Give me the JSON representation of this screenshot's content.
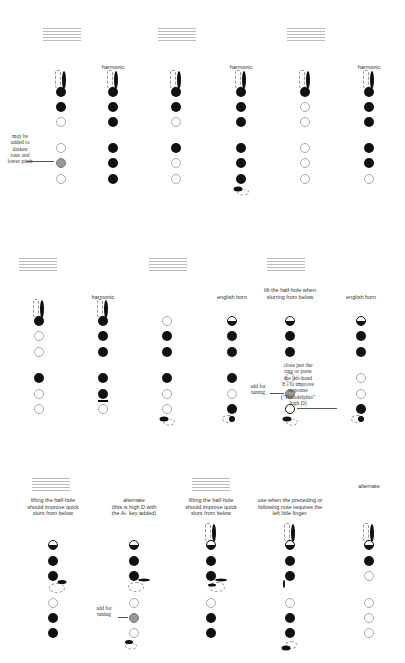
{
  "colors": {
    "closed": "#111111",
    "open_border": "#aaaaaa",
    "gray": "#999999",
    "staff": "#bbbbbb"
  },
  "legend": {
    "closed": "filled black circle = closed hole",
    "open": "white circle = open hole",
    "gray": "gray circle = optional hole",
    "half": "half-filled = half-hole"
  },
  "rows": [
    {
      "staffs": [
        {
          "x": 43,
          "y": 22,
          "notes": "𝅝"
        },
        {
          "x": 158,
          "y": 22,
          "notes": "♯𝅝 ♭𝅝"
        },
        {
          "x": 287,
          "y": 22,
          "notes": "𝅝"
        }
      ],
      "columns": [
        {
          "x": 61,
          "label": "",
          "octave": true,
          "holes": [
            "closed",
            "closed",
            "open",
            "open",
            "gray",
            "open"
          ]
        },
        {
          "x": 113,
          "label": "harmonic",
          "octave": true,
          "holes": [
            "closed",
            "closed",
            "closed",
            "closed",
            "closed",
            "closed"
          ]
        },
        {
          "x": 176,
          "label": "",
          "octave": true,
          "holes": [
            "closed",
            "closed",
            "open",
            "closed",
            "open",
            "open"
          ]
        },
        {
          "x": 241,
          "label": "harmonic",
          "octave": true,
          "holes": [
            "closed",
            "closed",
            "closed",
            "closed",
            "closed",
            "closed"
          ],
          "extra": "low-key"
        },
        {
          "x": 305,
          "label": "",
          "octave": true,
          "holes": [
            "closed",
            "open",
            "open",
            "open",
            "open",
            "open"
          ]
        },
        {
          "x": 369,
          "label": "harmonic",
          "octave": true,
          "holes": [
            "closed",
            "closed",
            "closed",
            "closed",
            "closed",
            "open"
          ]
        }
      ],
      "annotations": [
        {
          "id": "may-be-added",
          "text": [
            "may be",
            "added to",
            "darken",
            "tone and",
            "lower pitch"
          ],
          "x": 20,
          "y": 133
        }
      ]
    },
    {
      "staffs": [
        {
          "x": 19,
          "y": 252,
          "notes": "𝅝"
        },
        {
          "x": 149,
          "y": 252,
          "notes": "♯𝅝 ♭𝅝"
        },
        {
          "x": 267,
          "y": 252,
          "notes": "𝅝"
        }
      ],
      "columns": [
        {
          "x": 39,
          "label": "",
          "octave": true,
          "holes": [
            "closed",
            "open",
            "open",
            "closed",
            "open",
            "open"
          ]
        },
        {
          "x": 103,
          "label": "harmonic",
          "octave": true,
          "holes": [
            "closed",
            "closed",
            "closed",
            "closed",
            "closed",
            "open"
          ],
          "extra": "bar"
        },
        {
          "x": 167,
          "label": "",
          "octave": false,
          "holes": [
            "open",
            "closed",
            "closed",
            "closed",
            "open",
            "open"
          ],
          "extra": "low-key"
        },
        {
          "x": 232,
          "label": "english horn",
          "octave": false,
          "holes": [
            "half",
            "closed",
            "closed",
            "closed",
            "open",
            "closed"
          ],
          "extra": "low-key-dashed"
        },
        {
          "x": 290,
          "label": "lift the half-hole when slurring from below",
          "octave": false,
          "holes": [
            "half",
            "closed",
            "closed",
            "open",
            "gray",
            "bold"
          ],
          "extra": "low-key"
        },
        {
          "x": 361,
          "label": "english horn",
          "octave": false,
          "holes": [
            "half",
            "closed",
            "closed",
            "open",
            "open",
            "closed"
          ],
          "extra": "low-key-dashed"
        }
      ],
      "annotations": [
        {
          "id": "add-for-tuning-1",
          "text": [
            "add for",
            "tuning"
          ],
          "x": 258,
          "y": 383
        },
        {
          "id": "close-ring",
          "text": [
            "close just the",
            "ring or press",
            "the left-hand",
            "E♭ to improve",
            "response",
            "(\"Philadelphia\"",
            "high D)"
          ],
          "x": 298,
          "y": 362
        }
      ]
    },
    {
      "staffs": [
        {
          "x": 32,
          "y": 472,
          "notes": "♯𝅝 ♭𝅝"
        },
        {
          "x": 192,
          "y": 472,
          "notes": "𝅝"
        }
      ],
      "columns": [
        {
          "x": 53,
          "label": "lifting the half-hole should improve quick slurs from below",
          "octave": false,
          "holes": [
            "half",
            "closed",
            "closed",
            "open",
            "closed",
            "closed"
          ],
          "extra": "side-keys-a"
        },
        {
          "x": 134,
          "label": "alternate (this is high D with the A♭ key added)",
          "octave": false,
          "holes": [
            "half",
            "closed",
            "closed",
            "open",
            "gray",
            "open"
          ],
          "extra": "side-keys-b"
        },
        {
          "x": 211,
          "label": "lifting the half-hole should improve quick slurs from below",
          "octave": true,
          "holes": [
            "half",
            "closed",
            "closed",
            "open",
            "closed",
            "closed"
          ],
          "extra": "side-keys-c"
        },
        {
          "x": 290,
          "label": "use when the preceding or following note requires the left little finger.",
          "octave": true,
          "holes": [
            "half",
            "closed",
            "closed",
            "open",
            "closed",
            "closed"
          ],
          "extra": "side-keys-d"
        },
        {
          "x": 369,
          "label": "alternate",
          "octave": true,
          "holes": [
            "half",
            "closed",
            "open",
            "open",
            "open",
            "open"
          ]
        }
      ],
      "annotations": [
        {
          "id": "add-for-tuning-2",
          "text": [
            "add for",
            "tuning"
          ],
          "x": 104,
          "y": 605
        }
      ]
    }
  ],
  "text": {
    "harmonic": "harmonic",
    "english_horn": "english horn",
    "lift_half_hole": [
      "lift the half-hole when",
      "slurring from below"
    ],
    "lifting_half_hole": [
      "lifting the half-hole",
      "should improve quick",
      "slurs from below"
    ],
    "alternate_high_d": [
      "alternate",
      "(this is high D with",
      "the A♭ key added)"
    ],
    "use_when": [
      "use when the preceding or",
      "following note requires the",
      "left little finger."
    ],
    "alternate": "alternate",
    "may_be_added": [
      "may be",
      "added to",
      "darken",
      "tone and",
      "lower pitch"
    ],
    "add_for_tuning": [
      "add for",
      "tuning"
    ],
    "close_ring": [
      "close just the",
      "ring or press",
      "the left-hand",
      "E♭ to improve",
      "response",
      "(\"Philadelphia\"",
      "high D)"
    ],
    "natural_note": "𝅝",
    "sharp_flat_notes": "♯o ♭o",
    "whole_note": "o"
  }
}
